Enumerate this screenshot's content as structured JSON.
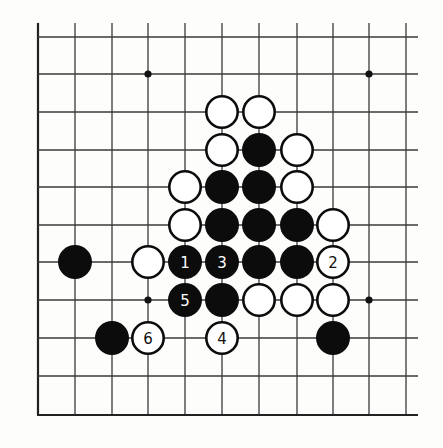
{
  "board": {
    "description": "Go board corner diagram (lower-left corner, 11x11 visible lines)",
    "columns_x": [
      38,
      75,
      112,
      148,
      185,
      222,
      259,
      297,
      333,
      369,
      406
    ],
    "rows_y": [
      37,
      74,
      112,
      150,
      187,
      225,
      262,
      300,
      338,
      376,
      415
    ],
    "line_color": "#3a3a3a",
    "stone_radius": 17,
    "open_top_extend": 14,
    "open_right_extend": 12,
    "edges": [
      "left",
      "bottom"
    ],
    "star_points": [
      {
        "col": 3,
        "row": 1
      },
      {
        "col": 9,
        "row": 1
      },
      {
        "col": 3,
        "row": 7
      },
      {
        "col": 9,
        "row": 7
      }
    ],
    "stones": [
      {
        "col": 5,
        "row": 2,
        "color": "white",
        "label": ""
      },
      {
        "col": 6,
        "row": 2,
        "color": "white",
        "label": ""
      },
      {
        "col": 5,
        "row": 3,
        "color": "white",
        "label": ""
      },
      {
        "col": 6,
        "row": 3,
        "color": "black",
        "label": ""
      },
      {
        "col": 7,
        "row": 3,
        "color": "white",
        "label": ""
      },
      {
        "col": 4,
        "row": 4,
        "color": "white",
        "label": ""
      },
      {
        "col": 5,
        "row": 4,
        "color": "black",
        "label": ""
      },
      {
        "col": 6,
        "row": 4,
        "color": "black",
        "label": ""
      },
      {
        "col": 7,
        "row": 4,
        "color": "white",
        "label": ""
      },
      {
        "col": 4,
        "row": 5,
        "color": "white",
        "label": ""
      },
      {
        "col": 5,
        "row": 5,
        "color": "black",
        "label": ""
      },
      {
        "col": 6,
        "row": 5,
        "color": "black",
        "label": ""
      },
      {
        "col": 7,
        "row": 5,
        "color": "black",
        "label": ""
      },
      {
        "col": 8,
        "row": 5,
        "color": "white",
        "label": ""
      },
      {
        "col": 1,
        "row": 6,
        "color": "black",
        "label": ""
      },
      {
        "col": 3,
        "row": 6,
        "color": "white",
        "label": ""
      },
      {
        "col": 4,
        "row": 6,
        "color": "black",
        "label": "1"
      },
      {
        "col": 5,
        "row": 6,
        "color": "black",
        "label": "3"
      },
      {
        "col": 6,
        "row": 6,
        "color": "black",
        "label": ""
      },
      {
        "col": 7,
        "row": 6,
        "color": "black",
        "label": ""
      },
      {
        "col": 8,
        "row": 6,
        "color": "white",
        "label": "2"
      },
      {
        "col": 4,
        "row": 7,
        "color": "black",
        "label": "5"
      },
      {
        "col": 5,
        "row": 7,
        "color": "black",
        "label": ""
      },
      {
        "col": 6,
        "row": 7,
        "color": "white",
        "label": ""
      },
      {
        "col": 7,
        "row": 7,
        "color": "white",
        "label": ""
      },
      {
        "col": 8,
        "row": 7,
        "color": "white",
        "label": ""
      },
      {
        "col": 2,
        "row": 8,
        "color": "black",
        "label": ""
      },
      {
        "col": 3,
        "row": 8,
        "color": "white",
        "label": "6"
      },
      {
        "col": 5,
        "row": 8,
        "color": "white",
        "label": "4"
      },
      {
        "col": 8,
        "row": 8,
        "color": "black",
        "label": ""
      }
    ]
  }
}
